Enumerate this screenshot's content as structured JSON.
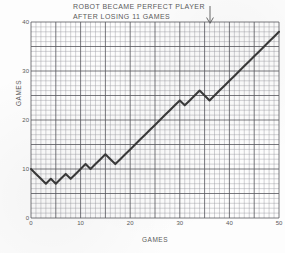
{
  "figure": {
    "background_color": "#fdfdfd",
    "grid_color": "#9a9aa0",
    "grid_major_color": "#56565c",
    "line_color": "#3a3a3a",
    "text_color": "#5a5a5a",
    "annotation": {
      "icon": "down-arrow-icon",
      "x_value": 36
    }
  },
  "chart_data": {
    "type": "line",
    "title": "ROBOT BECAME PERFECT PLAYER AFTER LOSING 11 GAMES",
    "title_lines": [
      "ROBOT BECAME PERFECT PLAYER",
      "AFTER LOSING 11 GAMES"
    ],
    "xlabel": "GAMES",
    "ylabel": "GAMES",
    "xlim": [
      0,
      50
    ],
    "ylim": [
      0,
      40
    ],
    "xticks": [
      0,
      10,
      20,
      30,
      40,
      50
    ],
    "yticks": [
      0,
      10,
      20,
      30,
      40
    ],
    "x_minor_step": 1,
    "y_minor_step": 1,
    "x_major_step": 5,
    "y_major_step": 5,
    "grid": true,
    "legend": null,
    "annotations": [
      {
        "text": "ROBOT BECAME PERFECT PLAYER AFTER LOSING 11 GAMES",
        "arrow": "down",
        "x": 36
      }
    ],
    "series": [
      {
        "name": "cumulative games won",
        "x": [
          0,
          1,
          2,
          3,
          4,
          5,
          6,
          7,
          8,
          9,
          10,
          11,
          12,
          13,
          14,
          15,
          16,
          17,
          18,
          19,
          20,
          21,
          22,
          23,
          24,
          25,
          26,
          27,
          28,
          29,
          30,
          31,
          32,
          33,
          34,
          35,
          36,
          37,
          38,
          39,
          40,
          41,
          42,
          43,
          44,
          45,
          46,
          47,
          48,
          49,
          50
        ],
        "y": [
          10,
          9,
          8,
          7,
          8,
          7,
          8,
          9,
          8,
          9,
          10,
          11,
          10,
          11,
          12,
          13,
          12,
          11,
          12,
          13,
          14,
          15,
          16,
          17,
          18,
          19,
          20,
          21,
          22,
          23,
          24,
          23,
          24,
          25,
          26,
          25,
          24,
          25,
          26,
          27,
          28,
          29,
          30,
          31,
          32,
          33,
          34,
          35,
          36,
          37,
          38
        ]
      }
    ]
  }
}
